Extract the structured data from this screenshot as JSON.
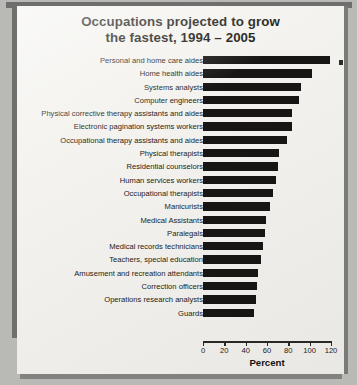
{
  "chart_data": {
    "type": "bar",
    "orientation": "horizontal",
    "title": "Occupations projected to grow the fastest, 1994 – 2005",
    "title_line1": "Occupations projected to grow",
    "title_line2": "the fastest, 1994 – 2005",
    "xlabel": "Percent",
    "ylabel": "",
    "xlim": [
      0,
      120
    ],
    "xticks": [
      0,
      20,
      40,
      60,
      80,
      100,
      120
    ],
    "xticklabels": [
      "0",
      "20",
      "40",
      "60",
      "80",
      "100",
      "120"
    ],
    "grid": false,
    "legend": false,
    "bar_color": "#171614",
    "background_color": "#f3f2ee",
    "categories": [
      "Personal and home care aides",
      "Home health aides",
      "Systems analysts",
      "Computer engineers",
      "Physical corrective therapy assistants and aides",
      "Electronic pagination systems workers",
      "Occupational therapy assistants and aides",
      "Physical therapists",
      "Residential counselors",
      "Human services workers",
      "Occupational therapists",
      "Manicurists",
      "Medical Assistants",
      "Paralegals",
      "Medical records technicians",
      "Teachers, special education",
      "Amusement and recreation attendants",
      "Correction officers",
      "Operations research analysts",
      "Guards"
    ],
    "values": [
      119,
      102,
      92,
      90,
      83,
      83,
      79,
      71,
      70,
      68,
      66,
      63,
      59,
      58,
      56,
      54,
      52,
      51,
      50,
      48
    ]
  }
}
